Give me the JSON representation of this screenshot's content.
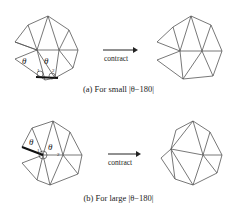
{
  "panels": [
    {
      "id": "a",
      "caption": "(a) For small |θ−180|",
      "arrow_label": "contract",
      "labels": {
        "theta1": "θ",
        "theta2": "θ",
        "v1": "1",
        "v2": "2"
      }
    },
    {
      "id": "b",
      "caption": "(b) For large |θ−180|",
      "arrow_label": "contract",
      "labels": {
        "theta1": "θ",
        "theta2": "θ",
        "v1": "1",
        "v2": "2"
      }
    }
  ],
  "colors": {
    "line": "#555555",
    "highlight": "#111111",
    "text": "#222222"
  }
}
